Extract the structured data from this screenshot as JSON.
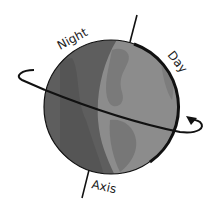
{
  "diagram": {
    "labels": {
      "night": "Night",
      "day": "Day",
      "axis": "Axis"
    },
    "colors": {
      "night_side": "#5e5e5e",
      "night_land": "#4f4f4f",
      "day_side": "#8c8c8c",
      "day_land": "#777777",
      "outline": "#111111",
      "background": "#ffffff"
    },
    "icons": {
      "globe": "globe-icon",
      "rotation_arrow": "curved-arrow-icon",
      "axis_line": "axis-line"
    }
  }
}
